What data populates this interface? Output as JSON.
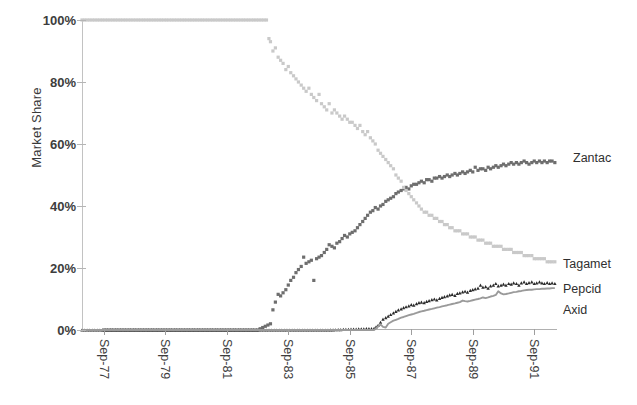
{
  "chart_data": {
    "type": "scatter",
    "title": "",
    "subtitle": "",
    "xlabel": "",
    "ylabel": "Market Share",
    "ylim": [
      0,
      100
    ],
    "yticks": [
      0,
      20,
      40,
      60,
      80,
      100
    ],
    "ytick_labels": [
      "0%",
      "20%",
      "40%",
      "60%",
      "80%",
      "100%"
    ],
    "xtick_labels": [
      "Sep-77",
      "Sep-79",
      "Sep-81",
      "Sep-83",
      "Sep-85",
      "Sep-87",
      "Sep-89",
      "Sep-91"
    ],
    "x_start": "Sep-77",
    "x_end": "Sep-92",
    "grid": false,
    "legend_position": "right-inline",
    "series": [
      {
        "name": "Zantac",
        "color": "#6e6e6e",
        "marker": "square",
        "label_x": 573,
        "label_y": 159,
        "final_value": 54,
        "x": [
          1977.71,
          1978.71,
          1979.71,
          1980.71,
          1981.71,
          1982.71,
          1983.13,
          1983.21,
          1983.29,
          1983.38,
          1983.46,
          1983.54,
          1983.63,
          1983.71,
          1983.79,
          1983.88,
          1983.96,
          1984.04,
          1984.13,
          1984.21,
          1984.29,
          1984.38,
          1984.46,
          1984.54,
          1984.63,
          1984.71,
          1984.79,
          1984.88,
          1984.96,
          1985.04,
          1985.13,
          1985.21,
          1985.29,
          1985.38,
          1985.46,
          1985.54,
          1985.63,
          1985.71,
          1985.79,
          1985.88,
          1985.96,
          1986.04,
          1986.13,
          1986.21,
          1986.29,
          1986.38,
          1986.46,
          1986.54,
          1986.63,
          1986.71,
          1986.79,
          1986.88,
          1986.96,
          1987.04,
          1987.13,
          1987.21,
          1987.29,
          1987.38,
          1987.46,
          1987.54,
          1987.63,
          1987.71,
          1987.79,
          1987.88,
          1987.96,
          1988.04,
          1988.13,
          1988.21,
          1988.29,
          1988.38,
          1988.46,
          1988.54,
          1988.63,
          1988.71,
          1988.79,
          1988.88,
          1988.96,
          1989.04,
          1989.13,
          1989.21,
          1989.29,
          1989.38,
          1989.46,
          1989.54,
          1989.63,
          1989.71,
          1989.79,
          1989.88,
          1989.96,
          1990.04,
          1990.13,
          1990.21,
          1990.29,
          1990.38,
          1990.46,
          1990.54,
          1990.63,
          1990.71,
          1990.79,
          1990.88,
          1990.96,
          1991.04,
          1991.13,
          1991.21,
          1991.29,
          1991.38,
          1991.46,
          1991.54,
          1991.63,
          1991.71,
          1991.79,
          1991.88,
          1991.96,
          1992.04,
          1992.13,
          1992.21,
          1992.29,
          1992.38
        ],
        "y": [
          0,
          0,
          0,
          0,
          0,
          0,
          2.0,
          6.5,
          9.0,
          11.5,
          11.0,
          12.0,
          13.0,
          14.5,
          16.0,
          17.0,
          18.5,
          19.5,
          20.5,
          23.5,
          21.5,
          22.0,
          22.5,
          16.0,
          23.0,
          23.5,
          24.0,
          25.0,
          26.0,
          27.5,
          27.0,
          26.5,
          28.0,
          28.5,
          29.5,
          30.5,
          30.0,
          31.0,
          31.5,
          32.0,
          33.0,
          34.0,
          35.0,
          36.0,
          37.0,
          38.0,
          38.5,
          39.5,
          39.0,
          40.0,
          40.5,
          41.5,
          42.0,
          42.5,
          43.0,
          44.0,
          44.5,
          45.0,
          45.5,
          46.0,
          45.5,
          46.5,
          47.0,
          47.0,
          47.5,
          48.0,
          47.5,
          48.5,
          48.5,
          48.0,
          49.0,
          49.0,
          49.5,
          49.0,
          49.5,
          50.0,
          49.5,
          50.0,
          50.5,
          50.0,
          50.5,
          51.0,
          50.5,
          51.0,
          51.5,
          51.0,
          52.5,
          51.5,
          52.0,
          52.0,
          51.5,
          52.5,
          52.0,
          52.5,
          53.0,
          52.5,
          53.0,
          53.5,
          53.0,
          53.5,
          54.0,
          53.5,
          54.0,
          53.5,
          54.0,
          54.5,
          54.0,
          53.5,
          54.0,
          54.5,
          54.0,
          54.5,
          54.0,
          54.5,
          54.0,
          54.5,
          54.5,
          54.0
        ]
      },
      {
        "name": "Tagamet",
        "color": "#c9c9c9",
        "marker": "square",
        "label_x": 563,
        "label_y": 265,
        "final_value": 22,
        "x": [
          1977.0,
          1978.0,
          1979.0,
          1980.0,
          1981.0,
          1982.0,
          1983.0,
          1983.08,
          1983.13,
          1983.21,
          1983.29,
          1983.38,
          1983.46,
          1983.54,
          1983.63,
          1983.71,
          1983.79,
          1983.88,
          1983.96,
          1984.04,
          1984.13,
          1984.21,
          1984.29,
          1984.38,
          1984.46,
          1984.54,
          1984.63,
          1984.71,
          1984.79,
          1984.88,
          1984.96,
          1985.04,
          1985.13,
          1985.21,
          1985.29,
          1985.38,
          1985.46,
          1985.54,
          1985.63,
          1985.71,
          1985.79,
          1985.88,
          1985.96,
          1986.04,
          1986.13,
          1986.21,
          1986.29,
          1986.38,
          1986.46,
          1986.54,
          1986.63,
          1986.71,
          1986.79,
          1986.88,
          1986.96,
          1987.04,
          1987.13,
          1987.21,
          1987.29,
          1987.38,
          1987.46,
          1987.54,
          1987.63,
          1987.71,
          1987.79,
          1987.88,
          1987.96,
          1988.04,
          1988.13,
          1988.21,
          1988.29,
          1988.38,
          1988.46,
          1988.54,
          1988.63,
          1988.71,
          1988.79,
          1988.88,
          1988.96,
          1989.04,
          1989.13,
          1989.21,
          1989.29,
          1989.38,
          1989.46,
          1989.54,
          1989.63,
          1989.71,
          1989.79,
          1989.88,
          1989.96,
          1990.04,
          1990.13,
          1990.21,
          1990.29,
          1990.38,
          1990.46,
          1990.54,
          1990.63,
          1990.71,
          1990.79,
          1990.88,
          1990.96,
          1991.04,
          1991.13,
          1991.21,
          1991.29,
          1991.38,
          1991.46,
          1991.54,
          1991.63,
          1991.71,
          1991.79,
          1991.88,
          1991.96,
          1992.04,
          1992.13,
          1992.21,
          1992.29,
          1992.38
        ],
        "y": [
          100,
          100,
          100,
          100,
          100,
          100,
          100,
          94,
          93,
          90,
          91,
          88,
          87,
          86,
          84,
          85,
          83,
          82,
          81,
          80,
          79,
          78,
          77,
          78,
          76,
          75,
          74,
          76,
          73,
          72,
          71,
          73,
          70,
          71,
          70,
          69,
          68,
          69,
          68,
          67,
          67,
          66,
          65,
          66,
          64,
          63,
          64,
          62,
          61,
          60,
          58,
          57,
          56,
          55,
          54,
          53,
          52,
          50,
          49,
          48,
          46,
          45,
          44,
          43,
          42,
          41,
          40,
          39,
          38,
          38,
          37,
          37,
          36,
          36,
          35,
          35,
          34,
          34,
          33,
          33,
          32,
          32,
          32,
          31,
          31,
          31,
          30,
          30,
          30,
          29,
          29,
          29,
          28,
          28,
          28,
          27,
          27,
          27,
          27,
          26,
          26,
          26,
          26,
          25,
          25,
          25,
          25,
          24,
          24,
          24,
          24,
          23,
          23,
          23,
          23,
          23,
          22,
          22,
          22,
          22
        ]
      },
      {
        "name": "Pepcid",
        "color": "#2b2b2b",
        "marker": "triangle",
        "label_x": 563,
        "label_y": 290,
        "final_value": 15,
        "x": [
          1977.0,
          1979.0,
          1981.0,
          1983.0,
          1985.0,
          1986.5,
          1986.63,
          1986.71,
          1986.79,
          1986.88,
          1986.96,
          1987.04,
          1987.13,
          1987.21,
          1987.29,
          1987.38,
          1987.46,
          1987.54,
          1987.63,
          1987.71,
          1987.79,
          1987.88,
          1987.96,
          1988.04,
          1988.13,
          1988.21,
          1988.29,
          1988.38,
          1988.46,
          1988.54,
          1988.63,
          1988.71,
          1988.79,
          1988.88,
          1988.96,
          1989.04,
          1989.13,
          1989.21,
          1989.29,
          1989.38,
          1989.46,
          1989.54,
          1989.63,
          1989.71,
          1989.79,
          1989.88,
          1989.96,
          1990.04,
          1990.13,
          1990.21,
          1990.29,
          1990.38,
          1990.46,
          1990.54,
          1990.63,
          1990.71,
          1990.79,
          1990.88,
          1990.96,
          1991.04,
          1991.13,
          1991.21,
          1991.29,
          1991.38,
          1991.46,
          1991.54,
          1991.63,
          1991.71,
          1991.79,
          1991.88,
          1991.96,
          1992.04,
          1992.13,
          1992.21,
          1992.29,
          1992.38
        ],
        "y": [
          0,
          0,
          0,
          0,
          0,
          0.5,
          1.5,
          2.5,
          3.5,
          4.0,
          4.5,
          5.0,
          5.5,
          6.0,
          6.5,
          6.8,
          7.2,
          7.5,
          7.8,
          8.2,
          8.0,
          8.5,
          8.8,
          9.0,
          8.8,
          9.2,
          9.5,
          9.8,
          10.0,
          9.7,
          10.2,
          10.5,
          10.8,
          11.0,
          11.3,
          11.5,
          11.2,
          11.8,
          12.0,
          12.3,
          12.5,
          12.2,
          12.8,
          13.0,
          13.3,
          13.5,
          14.5,
          13.8,
          14.0,
          13.5,
          14.2,
          14.5,
          15.0,
          14.2,
          14.5,
          14.8,
          14.5,
          15.0,
          14.8,
          15.2,
          15.0,
          14.5,
          15.2,
          15.5,
          15.0,
          15.3,
          15.5,
          15.0,
          15.2,
          15.5,
          15.2,
          15.0,
          15.3,
          15.0,
          15.2,
          15.0
        ]
      },
      {
        "name": "Axid",
        "color": "#9a9a9a",
        "marker": "line",
        "label_x": 563,
        "label_y": 311,
        "final_value": 13,
        "x": [
          1977.0,
          1979.0,
          1981.0,
          1983.0,
          1985.0,
          1986.5,
          1986.71,
          1986.79,
          1986.88,
          1986.96,
          1987.04,
          1987.13,
          1987.21,
          1987.29,
          1987.38,
          1987.46,
          1987.54,
          1987.63,
          1987.71,
          1987.79,
          1987.88,
          1987.96,
          1988.04,
          1988.13,
          1988.21,
          1988.29,
          1988.38,
          1988.46,
          1988.54,
          1988.63,
          1988.71,
          1988.79,
          1988.88,
          1988.96,
          1989.04,
          1989.13,
          1989.21,
          1989.29,
          1989.38,
          1989.46,
          1989.54,
          1989.63,
          1989.71,
          1989.79,
          1989.88,
          1989.96,
          1990.04,
          1990.13,
          1990.21,
          1990.29,
          1990.38,
          1990.46,
          1990.54,
          1990.63,
          1990.71,
          1990.79,
          1990.88,
          1990.96,
          1991.04,
          1991.13,
          1991.21,
          1991.29,
          1991.38,
          1991.46,
          1991.54,
          1991.63,
          1991.71,
          1991.79,
          1991.88,
          1991.96,
          1992.04,
          1992.13,
          1992.21,
          1992.29,
          1992.38
        ],
        "y": [
          0,
          0,
          0,
          0,
          0,
          0,
          1.8,
          1.0,
          0.8,
          2.0,
          2.5,
          3.0,
          3.3,
          3.6,
          4.0,
          4.2,
          4.5,
          4.8,
          5.0,
          5.2,
          5.5,
          5.8,
          6.0,
          6.2,
          6.4,
          6.6,
          6.8,
          7.0,
          7.2,
          7.4,
          7.6,
          7.8,
          8.0,
          8.2,
          8.4,
          8.6,
          8.8,
          9.0,
          9.5,
          9.3,
          9.2,
          9.4,
          9.6,
          9.8,
          10.0,
          10.2,
          10.5,
          10.3,
          10.5,
          10.8,
          11.0,
          11.3,
          12.5,
          11.8,
          11.5,
          11.6,
          11.8,
          12.0,
          12.2,
          12.3,
          12.5,
          12.6,
          12.8,
          12.9,
          13.0,
          13.0,
          13.1,
          13.2,
          13.2,
          13.3,
          13.3,
          13.4,
          13.4,
          13.5,
          13.5
        ]
      }
    ]
  },
  "axes": {
    "y_title": "Market Share"
  }
}
